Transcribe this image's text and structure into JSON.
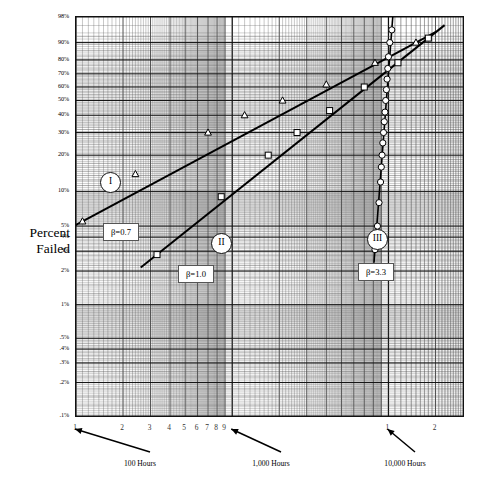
{
  "chart_data": {
    "type": "scatter",
    "plot_kind": "weibull-probability-plot",
    "title": "",
    "xlabel": "",
    "ylabel": "Percent Failed",
    "grid": true,
    "x_scale": "log",
    "y_scale": "weibull",
    "xlim": [
      100,
      30000
    ],
    "ylim": [
      0.1,
      98
    ],
    "x_tick_labels": [
      "1",
      "2",
      "3",
      "4",
      "5",
      "6",
      "7",
      "8",
      "9",
      "1",
      "2"
    ],
    "x_tick_values": [
      100,
      200,
      300,
      400,
      500,
      600,
      700,
      800,
      900,
      10000,
      20000
    ],
    "y_tick_labels": [
      "98%",
      "90%",
      "80%",
      "70%",
      "60%",
      "50%",
      "40%",
      "30%",
      "20%",
      "10%",
      "5%",
      "4%",
      "3%",
      "2%",
      "1%",
      ".5%",
      ".4%",
      ".3%",
      ".2%",
      ".1%"
    ],
    "y_tick_values": [
      98,
      90,
      80,
      70,
      60,
      50,
      40,
      30,
      20,
      10,
      5,
      4,
      3,
      2,
      1,
      0.5,
      0.4,
      0.3,
      0.2,
      0.1
    ],
    "annotations": [
      {
        "text": "100 Hours",
        "target_x": 100
      },
      {
        "text": "1,000 Hours",
        "target_x": 1000
      },
      {
        "text": "10,000 Hours",
        "target_x": 10000
      }
    ],
    "series": [
      {
        "name": "I",
        "label": "β=0.7",
        "beta": 0.7,
        "marker": "triangle",
        "points_percent": [
          5.5,
          14,
          30,
          40,
          50,
          62,
          78,
          90
        ],
        "points_hours": [
          110,
          240,
          700,
          1200,
          2100,
          4000,
          8200,
          15000
        ]
      },
      {
        "name": "II",
        "label": "β=1.0",
        "beta": 1.0,
        "marker": "square",
        "points_percent": [
          2.8,
          9,
          20,
          30,
          43,
          60,
          78,
          92
        ],
        "points_hours": [
          330,
          850,
          1700,
          2600,
          4200,
          7000,
          11500,
          18000
        ]
      },
      {
        "name": "III",
        "label": "β=3.3",
        "beta": 3.3,
        "marker": "circle",
        "points_percent": [
          3.1,
          5,
          8,
          12,
          16,
          20,
          25,
          30,
          36,
          42,
          50,
          58,
          66,
          74,
          82,
          90,
          95
        ],
        "points_hours": [
          8200,
          8500,
          8700,
          8900,
          9000,
          9100,
          9200,
          9300,
          9400,
          9500,
          9600,
          9700,
          9800,
          9900,
          10000,
          10200,
          10500
        ]
      }
    ]
  },
  "labels": {
    "axis_title_line1": "Percent",
    "axis_title_line2": "Failed"
  }
}
